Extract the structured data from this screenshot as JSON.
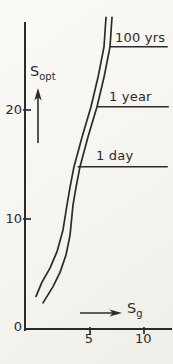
{
  "figure": {
    "background_color": "#f5f4ef",
    "line_color": "#2b2b2b"
  },
  "chart_data": {
    "type": "line",
    "title": "",
    "xlabel": "S",
    "xlabel_sub": "g",
    "ylabel": "S",
    "ylabel_sub": "opt",
    "xlim": [
      0,
      12.6
    ],
    "ylim": [
      0,
      28.5
    ],
    "grid": false,
    "x_ticks": [
      {
        "value": 5,
        "label": "5"
      },
      {
        "value": 10,
        "label": "10"
      }
    ],
    "y_ticks": [
      {
        "value": 0,
        "label": "0"
      },
      {
        "value": 10,
        "label": "10"
      },
      {
        "value": 20,
        "label": "20"
      }
    ],
    "series": [
      {
        "name": "curve-left",
        "points": [
          [
            0.0,
            2.9
          ],
          [
            0.56,
            4.2
          ],
          [
            1.3,
            5.5
          ],
          [
            1.94,
            7.0
          ],
          [
            2.5,
            9.0
          ],
          [
            2.87,
            11.3
          ],
          [
            3.15,
            12.9
          ],
          [
            3.52,
            14.8
          ],
          [
            4.26,
            17.5
          ],
          [
            5.09,
            20.3
          ],
          [
            5.74,
            23.0
          ],
          [
            6.3,
            25.8
          ],
          [
            6.48,
            28.5
          ]
        ]
      },
      {
        "name": "curve-right",
        "points": [
          [
            0.65,
            2.3
          ],
          [
            1.57,
            3.8
          ],
          [
            2.22,
            5.1
          ],
          [
            2.78,
            6.7
          ],
          [
            3.15,
            8.5
          ],
          [
            3.43,
            11.3
          ],
          [
            3.7,
            12.9
          ],
          [
            4.07,
            14.8
          ],
          [
            4.81,
            17.5
          ],
          [
            5.65,
            20.3
          ],
          [
            6.3,
            23.0
          ],
          [
            6.85,
            25.8
          ],
          [
            7.04,
            28.5
          ]
        ]
      }
    ],
    "ref_lines": [
      {
        "label": "100 yrs",
        "s_opt": 25.8,
        "sg_start": 6.85,
        "sg_end": 12.2
      },
      {
        "label": "1 year",
        "s_opt": 20.3,
        "sg_start": 5.65,
        "sg_end": 12.3
      },
      {
        "label": "1 day",
        "s_opt": 14.8,
        "sg_start": 3.85,
        "sg_end": 12.2
      }
    ],
    "layout": {
      "x_origin_px": 36,
      "x_px_per_unit": 10.8,
      "y_origin_px": 328,
      "y_px_per_unit": 10.9,
      "y_axis_x": 25,
      "y_axis_top_px": 23,
      "x_axis_y": 329,
      "x_axis_right_px": 171,
      "legend": "none"
    }
  }
}
